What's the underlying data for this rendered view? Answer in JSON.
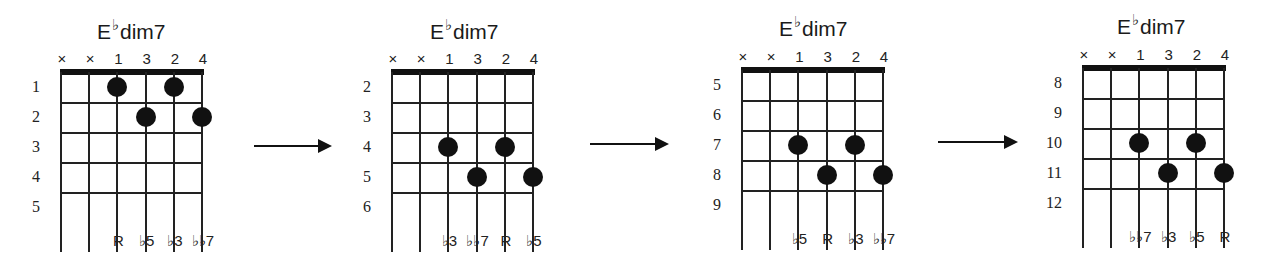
{
  "diagrams": [
    {
      "title": {
        "root": "E",
        "accidental": "♭",
        "quality": "dim7"
      },
      "string_marks": [
        "×",
        "×",
        "1",
        "3",
        "2",
        "4"
      ],
      "fret_numbers": [
        "1",
        "2",
        "3",
        "4",
        "5"
      ],
      "dots": [
        {
          "string": 3,
          "fret": 1,
          "finger": "1"
        },
        {
          "string": 4,
          "fret": 2,
          "finger": "3"
        },
        {
          "string": 5,
          "fret": 1,
          "finger": "2"
        },
        {
          "string": 6,
          "fret": 2,
          "finger": "4"
        }
      ],
      "intervals": [
        "R",
        "♭5",
        "♭3",
        "♭♭7"
      ]
    },
    {
      "title": {
        "root": "E",
        "accidental": "♭",
        "quality": "dim7"
      },
      "string_marks": [
        "×",
        "×",
        "1",
        "3",
        "2",
        "4"
      ],
      "fret_numbers": [
        "2",
        "3",
        "4",
        "5",
        "6"
      ],
      "dots": [
        {
          "string": 3,
          "fret": 3,
          "finger": "1"
        },
        {
          "string": 4,
          "fret": 4,
          "finger": "3"
        },
        {
          "string": 5,
          "fret": 3,
          "finger": "2"
        },
        {
          "string": 6,
          "fret": 4,
          "finger": "4"
        }
      ],
      "intervals": [
        "♭3",
        "♭♭7",
        "R",
        "♭5"
      ]
    },
    {
      "title": {
        "root": "E",
        "accidental": "♭",
        "quality": "dim7"
      },
      "string_marks": [
        "×",
        "×",
        "1",
        "3",
        "2",
        "4"
      ],
      "fret_numbers": [
        "5",
        "6",
        "7",
        "8",
        "9"
      ],
      "dots": [
        {
          "string": 3,
          "fret": 3,
          "finger": "1"
        },
        {
          "string": 4,
          "fret": 4,
          "finger": "3"
        },
        {
          "string": 5,
          "fret": 3,
          "finger": "2"
        },
        {
          "string": 6,
          "fret": 4,
          "finger": "4"
        }
      ],
      "intervals": [
        "♭5",
        "R",
        "♭3",
        "♭♭7"
      ]
    },
    {
      "title": {
        "root": "E",
        "accidental": "♭",
        "quality": "dim7"
      },
      "string_marks": [
        "×",
        "×",
        "1",
        "3",
        "2",
        "4"
      ],
      "fret_numbers": [
        "8",
        "9",
        "10",
        "11",
        "12"
      ],
      "dots": [
        {
          "string": 3,
          "fret": 3,
          "finger": "1"
        },
        {
          "string": 4,
          "fret": 4,
          "finger": "3"
        },
        {
          "string": 5,
          "fret": 3,
          "finger": "2"
        },
        {
          "string": 6,
          "fret": 4,
          "finger": "4"
        }
      ],
      "intervals": [
        "♭♭7",
        "♭3",
        "♭5",
        "R"
      ]
    }
  ],
  "arrows": [
    {
      "label": "next-position-arrow"
    },
    {
      "label": "next-position-arrow"
    },
    {
      "label": "next-position-arrow"
    }
  ]
}
